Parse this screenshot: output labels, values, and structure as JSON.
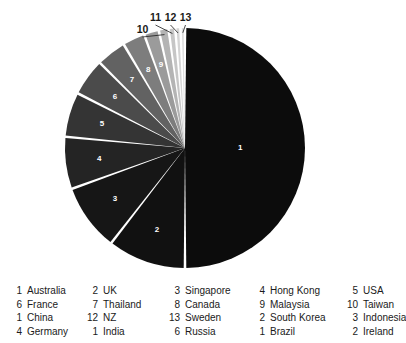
{
  "chart_data": {
    "type": "pie",
    "title": "",
    "legend_position": "bottom",
    "grid": false,
    "start_angle_deg": 0,
    "direction": "clockwise",
    "center": {
      "x": 185,
      "y": 148
    },
    "radius": 120,
    "categories": [
      "Australia",
      "UK",
      "Singapore",
      "Hong Kong",
      "USA",
      "France",
      "Thailand",
      "Canada",
      "Malaysia",
      "Taiwan",
      "China",
      "NZ",
      "Sweden"
    ],
    "values": [
      50.0,
      10.5,
      9.0,
      7.0,
      6.0,
      5.0,
      4.0,
      3.0,
      2.0,
      1.3,
      0.9,
      0.7,
      0.6
    ],
    "labels": [
      "1",
      "2",
      "3",
      "4",
      "5",
      "6",
      "7",
      "8",
      "9",
      "10",
      "11",
      "12",
      "13"
    ],
    "colors": [
      "#0c0c0c",
      "#111111",
      "#161616",
      "#242424",
      "#343434",
      "#4b4b4b",
      "#626262",
      "#7d7d7d",
      "#9b9b9b",
      "#b4b4b4",
      "#c6c6c6",
      "#d4d4d4",
      "#dedede"
    ],
    "separator_color": "#ffffff",
    "inner_label_color": "#ffffff",
    "outer_label_color": "#1a1a1a",
    "slices": [
      {
        "label": "1",
        "name": "Australia",
        "value": 50.0,
        "color": "#0c0c0c",
        "label_placement": "inside"
      },
      {
        "label": "2",
        "name": "UK",
        "value": 10.5,
        "color": "#111111",
        "label_placement": "inside"
      },
      {
        "label": "3",
        "name": "Singapore",
        "value": 9.0,
        "color": "#161616",
        "label_placement": "inside"
      },
      {
        "label": "4",
        "name": "Hong Kong",
        "value": 7.0,
        "color": "#242424",
        "label_placement": "inside"
      },
      {
        "label": "5",
        "name": "USA",
        "value": 6.0,
        "color": "#343434",
        "label_placement": "inside"
      },
      {
        "label": "6",
        "name": "France",
        "value": 5.0,
        "color": "#4b4b4b",
        "label_placement": "inside"
      },
      {
        "label": "7",
        "name": "Thailand",
        "value": 4.0,
        "color": "#626262",
        "label_placement": "inside"
      },
      {
        "label": "8",
        "name": "Canada",
        "value": 3.0,
        "color": "#7d7d7d",
        "label_placement": "inside"
      },
      {
        "label": "9",
        "name": "Malaysia",
        "value": 2.0,
        "color": "#9b9b9b",
        "label_placement": "inside"
      },
      {
        "label": "10",
        "name": "Taiwan",
        "value": 1.3,
        "color": "#b4b4b4",
        "label_placement": "outside"
      },
      {
        "label": "11",
        "name": "China",
        "value": 0.9,
        "color": "#c6c6c6",
        "label_placement": "outside"
      },
      {
        "label": "12",
        "name": "NZ",
        "value": 0.7,
        "color": "#d4d4d4",
        "label_placement": "outside"
      },
      {
        "label": "13",
        "name": "Sweden",
        "value": 0.6,
        "color": "#dedede",
        "label_placement": "outside"
      }
    ]
  },
  "legend": {
    "rows": [
      [
        {
          "num": "1",
          "name": "Australia"
        },
        {
          "num": "2",
          "name": "UK"
        },
        {
          "num": "3",
          "name": "Singapore"
        },
        {
          "num": "4",
          "name": "Hong Kong"
        },
        {
          "num": "5",
          "name": "USA"
        }
      ],
      [
        {
          "num": "6",
          "name": "France"
        },
        {
          "num": "7",
          "name": "Thailand"
        },
        {
          "num": "8",
          "name": "Canada"
        },
        {
          "num": "9",
          "name": "Malaysia"
        },
        {
          "num": "10",
          "name": "Taiwan"
        }
      ],
      [
        {
          "num": "1",
          "name": "China"
        },
        {
          "num": "12",
          "name": "NZ"
        },
        {
          "num": "13",
          "name": "Sweden"
        },
        {
          "num": "2",
          "name": "South Korea"
        },
        {
          "num": "3",
          "name": "Indonesia"
        }
      ],
      [
        {
          "num": "4",
          "name": "Germany"
        },
        {
          "num": "1",
          "name": "India"
        },
        {
          "num": "6",
          "name": "Russia"
        },
        {
          "num": "1",
          "name": "Brazil"
        },
        {
          "num": "2",
          "name": "Ireland"
        }
      ]
    ]
  }
}
